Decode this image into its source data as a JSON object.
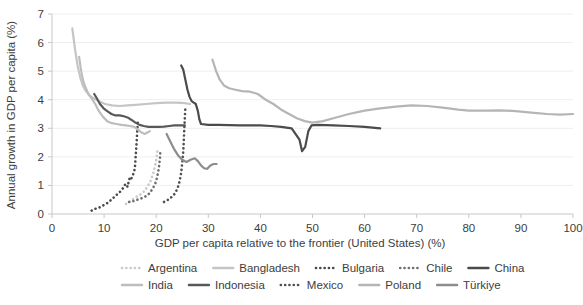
{
  "chart_data": {
    "type": "line",
    "title": "",
    "xlabel": "GDP per capita relative to the frontier (United States) (%)",
    "ylabel": "Annual growth in GDP per capita (%)",
    "xlim": [
      0,
      100
    ],
    "ylim": [
      0,
      7
    ],
    "xticks": [
      0,
      10,
      20,
      30,
      40,
      50,
      60,
      70,
      80,
      90,
      100
    ],
    "yticks": [
      0,
      1,
      2,
      3,
      4,
      5,
      6,
      7
    ],
    "grid": "horizontal",
    "legend_position": "bottom",
    "series": [
      {
        "name": "Argentina",
        "style": "dotted",
        "color": "#c9c9c9",
        "points": [
          [
            14.2,
            0.35
          ],
          [
            14.8,
            0.42
          ],
          [
            15.4,
            0.5
          ],
          [
            16.0,
            0.58
          ],
          [
            16.8,
            0.66
          ],
          [
            17.6,
            0.78
          ],
          [
            18.3,
            0.95
          ],
          [
            18.9,
            1.15
          ],
          [
            19.4,
            1.4
          ],
          [
            19.8,
            1.7
          ],
          [
            20.1,
            2.0
          ],
          [
            20.3,
            2.3
          ]
        ]
      },
      {
        "name": "Bangladesh",
        "style": "solid",
        "color": "#c5c5c5",
        "points": [
          [
            3.9,
            6.5
          ],
          [
            4.4,
            5.8
          ],
          [
            4.9,
            5.2
          ],
          [
            5.4,
            4.8
          ],
          [
            5.9,
            4.5
          ],
          [
            6.5,
            4.3
          ],
          [
            7.2,
            4.15
          ],
          [
            8.0,
            4.05
          ],
          [
            9.0,
            3.95
          ],
          [
            10.2,
            3.85
          ],
          [
            11.5,
            3.8
          ],
          [
            13.0,
            3.78
          ],
          [
            14.5,
            3.8
          ],
          [
            16.0,
            3.82
          ],
          [
            18.0,
            3.85
          ],
          [
            20.0,
            3.88
          ],
          [
            22.0,
            3.9
          ],
          [
            24.0,
            3.9
          ],
          [
            25.5,
            3.88
          ],
          [
            26.5,
            3.85
          ]
        ]
      },
      {
        "name": "Bulgaria",
        "style": "dotted",
        "color": "#4a4a4a",
        "points": [
          [
            7.6,
            0.12
          ],
          [
            8.3,
            0.18
          ],
          [
            9.0,
            0.22
          ],
          [
            9.8,
            0.3
          ],
          [
            10.6,
            0.38
          ],
          [
            11.4,
            0.5
          ],
          [
            12.1,
            0.62
          ],
          [
            12.7,
            0.72
          ],
          [
            13.2,
            0.8
          ],
          [
            13.7,
            0.92
          ],
          [
            14.0,
            1.02
          ],
          [
            14.3,
            1.05
          ],
          [
            14.5,
            0.95
          ],
          [
            14.7,
            1.12
          ],
          [
            14.9,
            1.25
          ],
          [
            15.1,
            1.2
          ],
          [
            15.4,
            1.3
          ],
          [
            15.7,
            1.45
          ],
          [
            15.9,
            1.6
          ],
          [
            16.0,
            1.85
          ],
          [
            16.1,
            2.1
          ],
          [
            16.2,
            2.4
          ],
          [
            16.3,
            2.7
          ],
          [
            16.4,
            3.0
          ],
          [
            16.5,
            3.3
          ]
        ]
      },
      {
        "name": "Chile",
        "style": "dotted",
        "color": "#6f6f6f",
        "points": [
          [
            14.8,
            0.42
          ],
          [
            15.6,
            0.45
          ],
          [
            16.4,
            0.5
          ],
          [
            17.2,
            0.55
          ],
          [
            18.0,
            0.62
          ],
          [
            18.7,
            0.72
          ],
          [
            19.3,
            0.88
          ],
          [
            19.8,
            1.05
          ],
          [
            20.2,
            1.3
          ],
          [
            20.5,
            1.6
          ],
          [
            20.7,
            1.9
          ],
          [
            20.8,
            2.2
          ]
        ]
      },
      {
        "name": "China",
        "style": "solid",
        "color": "#4b4b4b",
        "points": [
          [
            24.8,
            5.2
          ],
          [
            25.2,
            5.05
          ],
          [
            25.6,
            4.7
          ],
          [
            26.0,
            4.35
          ],
          [
            26.4,
            4.1
          ],
          [
            26.8,
            3.95
          ],
          [
            27.2,
            3.9
          ],
          [
            27.6,
            3.85
          ],
          [
            28.0,
            3.6
          ],
          [
            28.3,
            3.3
          ],
          [
            28.6,
            3.15
          ],
          [
            30.0,
            3.12
          ],
          [
            32.0,
            3.12
          ],
          [
            34.0,
            3.11
          ],
          [
            36.0,
            3.1
          ],
          [
            38.0,
            3.1
          ],
          [
            40.0,
            3.1
          ],
          [
            42.0,
            3.08
          ],
          [
            44.0,
            3.05
          ],
          [
            46.0,
            3.0
          ],
          [
            47.5,
            2.6
          ],
          [
            48.0,
            2.2
          ],
          [
            48.6,
            2.35
          ],
          [
            49.2,
            2.9
          ],
          [
            49.8,
            3.1
          ],
          [
            51.0,
            3.12
          ],
          [
            54.0,
            3.1
          ],
          [
            57.0,
            3.08
          ],
          [
            60.0,
            3.05
          ],
          [
            63.0,
            3.0
          ]
        ]
      },
      {
        "name": "India",
        "style": "solid",
        "color": "#bdbdbd",
        "points": [
          [
            5.2,
            5.5
          ],
          [
            5.6,
            5.0
          ],
          [
            6.0,
            4.65
          ],
          [
            6.5,
            4.4
          ],
          [
            7.0,
            4.2
          ],
          [
            7.6,
            4.05
          ],
          [
            8.3,
            3.85
          ],
          [
            9.0,
            3.6
          ],
          [
            9.8,
            3.4
          ],
          [
            10.6,
            3.25
          ],
          [
            11.5,
            3.18
          ],
          [
            12.4,
            3.15
          ],
          [
            13.3,
            3.12
          ],
          [
            14.2,
            3.1
          ],
          [
            15.0,
            3.08
          ],
          [
            15.8,
            3.05
          ],
          [
            16.5,
            2.95
          ],
          [
            17.2,
            2.85
          ],
          [
            17.8,
            2.8
          ],
          [
            18.3,
            2.85
          ],
          [
            18.8,
            2.9
          ]
        ]
      },
      {
        "name": "Indonesia",
        "style": "solid",
        "color": "#585858",
        "points": [
          [
            8.1,
            4.2
          ],
          [
            8.6,
            4.05
          ],
          [
            9.2,
            3.85
          ],
          [
            9.9,
            3.7
          ],
          [
            10.6,
            3.6
          ],
          [
            11.4,
            3.5
          ],
          [
            12.2,
            3.45
          ],
          [
            13.0,
            3.45
          ],
          [
            13.8,
            3.42
          ],
          [
            14.5,
            3.38
          ],
          [
            15.2,
            3.3
          ],
          [
            16.0,
            3.2
          ],
          [
            16.8,
            3.12
          ],
          [
            17.6,
            3.08
          ],
          [
            18.5,
            3.05
          ],
          [
            19.5,
            3.05
          ],
          [
            20.5,
            3.05
          ],
          [
            21.5,
            3.06
          ],
          [
            22.5,
            3.08
          ],
          [
            23.5,
            3.1
          ],
          [
            24.5,
            3.1
          ],
          [
            25.5,
            3.1
          ]
        ]
      },
      {
        "name": "Mexico",
        "style": "dotted",
        "color": "#505050",
        "points": [
          [
            21.5,
            0.42
          ],
          [
            22.3,
            0.5
          ],
          [
            23.0,
            0.6
          ],
          [
            23.6,
            0.72
          ],
          [
            24.1,
            0.9
          ],
          [
            24.5,
            1.15
          ],
          [
            24.8,
            1.45
          ],
          [
            25.0,
            1.8
          ],
          [
            25.2,
            2.2
          ],
          [
            25.3,
            2.6
          ],
          [
            25.4,
            3.0
          ],
          [
            25.5,
            3.4
          ],
          [
            25.6,
            3.7
          ]
        ]
      },
      {
        "name": "Poland",
        "style": "solid",
        "color": "#b5b5b5",
        "points": [
          [
            30.8,
            5.4
          ],
          [
            31.5,
            5.0
          ],
          [
            32.2,
            4.7
          ],
          [
            33.0,
            4.5
          ],
          [
            34.0,
            4.4
          ],
          [
            35.2,
            4.35
          ],
          [
            36.5,
            4.3
          ],
          [
            38.0,
            4.28
          ],
          [
            39.5,
            4.2
          ],
          [
            41.0,
            4.0
          ],
          [
            42.5,
            3.85
          ],
          [
            44.0,
            3.65
          ],
          [
            45.5,
            3.5
          ],
          [
            47.0,
            3.35
          ],
          [
            48.5,
            3.25
          ],
          [
            50.0,
            3.2
          ],
          [
            52.0,
            3.25
          ],
          [
            54.0,
            3.35
          ],
          [
            57.0,
            3.5
          ],
          [
            60.0,
            3.62
          ],
          [
            63.0,
            3.7
          ],
          [
            66.0,
            3.76
          ],
          [
            69.0,
            3.8
          ],
          [
            72.0,
            3.78
          ],
          [
            75.0,
            3.72
          ],
          [
            78.0,
            3.65
          ],
          [
            80.0,
            3.62
          ],
          [
            83.0,
            3.62
          ],
          [
            86.0,
            3.63
          ],
          [
            89.0,
            3.6
          ],
          [
            92.0,
            3.55
          ],
          [
            95.0,
            3.5
          ],
          [
            97.5,
            3.48
          ],
          [
            100.0,
            3.5
          ]
        ]
      },
      {
        "name": "Türkiye",
        "style": "solid",
        "color": "#8d8d8d",
        "points": [
          [
            22.0,
            2.8
          ],
          [
            22.8,
            2.5
          ],
          [
            23.5,
            2.25
          ],
          [
            24.2,
            2.05
          ],
          [
            25.0,
            1.9
          ],
          [
            25.8,
            1.82
          ],
          [
            26.6,
            1.9
          ],
          [
            27.4,
            1.95
          ],
          [
            28.0,
            1.85
          ],
          [
            28.6,
            1.7
          ],
          [
            29.2,
            1.6
          ],
          [
            29.8,
            1.58
          ],
          [
            30.4,
            1.7
          ],
          [
            31.0,
            1.75
          ],
          [
            31.6,
            1.75
          ]
        ]
      }
    ]
  },
  "legend": {
    "row1": [
      "Argentina",
      "Bangladesh",
      "Bulgaria",
      "Chile",
      "China"
    ],
    "row2": [
      "India",
      "Indonesia",
      "Mexico",
      "Poland",
      "Türkiye"
    ]
  },
  "colors": {
    "axis": "#c8c8c8",
    "grid": "#eeeeee",
    "text": "#3d3d3d",
    "background": "#ffffff"
  }
}
